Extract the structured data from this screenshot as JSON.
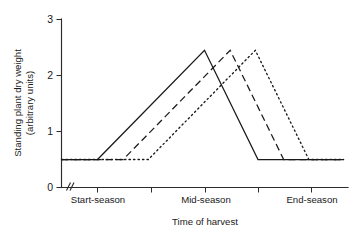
{
  "chart_data": {
    "type": "line",
    "title": "",
    "xlabel": "Time of harvest",
    "ylabel": "Standing plant dry weight (arbitrary units)",
    "ylabel_line1": "Standing plant dry weight",
    "ylabel_line2": "(arbitrary units)",
    "ylim": [
      0,
      3
    ],
    "yticks": [
      0,
      1,
      2,
      3
    ],
    "ytick_labels": [
      "0",
      "1",
      "2",
      "3"
    ],
    "xlim": [
      0,
      5
    ],
    "xticks": [
      1,
      2,
      3,
      4,
      5
    ],
    "xtick_labels": [
      "Start-season",
      "",
      "Mid-season",
      "",
      "End-season"
    ],
    "x_named_ticks": [
      {
        "value": 1,
        "label": "Start-season"
      },
      {
        "value": 3,
        "label": "Mid-season"
      },
      {
        "value": 5,
        "label": "End-season"
      }
    ],
    "grid": false,
    "legend": "none",
    "axis_break": {
      "present": true,
      "axis": "x",
      "symbol": "//",
      "note": "double-slash break mark on x-axis near origin"
    },
    "baseline_value": 0.5,
    "peak_value": 2.45,
    "series": [
      {
        "name": "Early cultivar",
        "style": "solid",
        "color": "#1a1a1a",
        "x": [
          0.0,
          1.0,
          3.0,
          4.0,
          5.6
        ],
        "y": [
          0.5,
          0.5,
          2.45,
          0.5,
          0.5
        ]
      },
      {
        "name": "Mid cultivar",
        "style": "dashed",
        "color": "#1a1a1a",
        "x": [
          0.0,
          1.48,
          3.48,
          4.48,
          5.6
        ],
        "y": [
          0.5,
          0.5,
          2.45,
          0.5,
          0.5
        ]
      },
      {
        "name": "Late cultivar",
        "style": "dotted",
        "color": "#1a1a1a",
        "x": [
          0.0,
          1.95,
          3.95,
          4.95,
          5.6
        ],
        "y": [
          0.5,
          0.5,
          2.45,
          0.5,
          0.5
        ]
      }
    ]
  },
  "axes": {
    "y_title_line1": "Standing plant dry weight",
    "y_title_line2": "(arbitrary units)",
    "x_title": "Time of harvest",
    "y_tick_0": "0",
    "y_tick_1": "1",
    "y_tick_2": "2",
    "y_tick_3": "3",
    "x_tick_start": "Start-season",
    "x_tick_mid": "Mid-season",
    "x_tick_end": "End-season"
  }
}
